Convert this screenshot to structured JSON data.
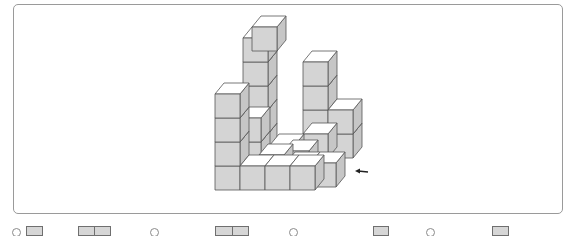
{
  "puzzle": {
    "description": "Isometric stack of unit cubes with a viewing-direction arrow",
    "colors": {
      "front_face": "#d4d4d4",
      "side_face": "#c6c6c6",
      "top_face": "#ffffff",
      "edge": "#555555",
      "frame_border": "#9a9a9a",
      "arrow": "#222222"
    },
    "cube": {
      "w": 25,
      "h": 24,
      "dx": 9,
      "dy": -11
    },
    "view_arrow": {
      "x1": 368,
      "y1": 172,
      "x2": 355,
      "y2": 171,
      "direction": "left"
    },
    "cubes": [
      {
        "x": 243,
        "y": 134,
        "comment": "back row base under tall tower"
      },
      {
        "x": 243,
        "y": 110
      },
      {
        "x": 243,
        "y": 86
      },
      {
        "x": 243,
        "y": 62
      },
      {
        "x": 243,
        "y": 38
      },
      {
        "x": 252,
        "y": 27
      },
      {
        "x": 303,
        "y": 110
      },
      {
        "x": 303,
        "y": 86
      },
      {
        "x": 303,
        "y": 62
      },
      {
        "x": 328,
        "y": 134
      },
      {
        "x": 328,
        "y": 110
      },
      {
        "x": 303,
        "y": 134
      },
      {
        "x": 236,
        "y": 142
      },
      {
        "x": 236,
        "y": 118
      },
      {
        "x": 270,
        "y": 145
      },
      {
        "x": 284,
        "y": 151
      },
      {
        "x": 259,
        "y": 155
      },
      {
        "x": 286,
        "y": 163
      },
      {
        "x": 311,
        "y": 163
      },
      {
        "x": 215,
        "y": 166
      },
      {
        "x": 215,
        "y": 142
      },
      {
        "x": 215,
        "y": 118
      },
      {
        "x": 215,
        "y": 94
      },
      {
        "x": 240,
        "y": 166
      },
      {
        "x": 265,
        "y": 166
      },
      {
        "x": 290,
        "y": 166
      }
    ]
  },
  "answer_options": [
    {
      "label": "A",
      "circle_x": 12,
      "box_x": 26,
      "box_w": 17,
      "cells": 1
    },
    {
      "label": "",
      "circle_x": null,
      "box_x": 78,
      "box_w": 33,
      "cells": 2
    },
    {
      "label": "B",
      "circle_x": 150,
      "box_x": null,
      "box_w": 0,
      "cells": 0
    },
    {
      "label": "",
      "circle_x": null,
      "box_x": 215,
      "box_w": 34,
      "cells": 2
    },
    {
      "label": "C",
      "circle_x": 289,
      "box_x": null,
      "box_w": 0,
      "cells": 0
    },
    {
      "label": "",
      "circle_x": null,
      "box_x": 373,
      "box_w": 16,
      "cells": 1
    },
    {
      "label": "D",
      "circle_x": 426,
      "box_x": null,
      "box_w": 0,
      "cells": 0
    },
    {
      "label": "",
      "circle_x": null,
      "box_x": 492,
      "box_w": 17,
      "cells": 1
    }
  ]
}
